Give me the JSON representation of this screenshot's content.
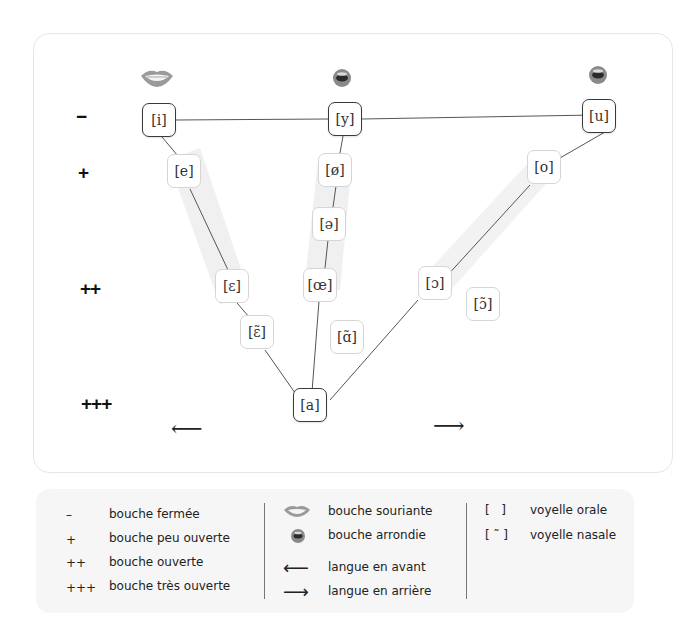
{
  "diagram": {
    "row_labels": [
      "−",
      "+",
      "++",
      "+++"
    ],
    "mouths": {
      "left": "smiling-mouth",
      "center": "rounded-mouth",
      "right": "rounded-mouth"
    },
    "arrows": {
      "left": "⟵",
      "right": "⟶"
    },
    "vowels": {
      "i": "[i]",
      "y": "[y]",
      "u": "[u]",
      "e": "[e]",
      "oe_closed": "[ø]",
      "o": "[o]",
      "schwa": "[ə]",
      "eps": "[ɛ]",
      "oe_open": "[œ]",
      "open_o": "[ɔ]",
      "nasal_o": "[ɔ̃]",
      "nasal_eps": "[ɛ̃]",
      "nasal_a": "[ɑ̃]",
      "a": "[a]"
    },
    "colors": {
      "corner_border": "#3a3a3a",
      "inner_border": "#d5d5d5",
      "band": "#efefef",
      "line": "#555555"
    }
  },
  "legend": {
    "col1": [
      {
        "symbol": "–",
        "label": "bouche fermée"
      },
      {
        "symbol": "+",
        "label": "bouche peu ouverte"
      },
      {
        "symbol": "++",
        "label": "bouche ouverte"
      },
      {
        "symbol": "+++",
        "label": "bouche très ouverte"
      }
    ],
    "col2": [
      {
        "symbol": "smiling-mouth",
        "label": "bouche souriante"
      },
      {
        "symbol": "rounded-mouth",
        "label": "bouche arrondie"
      },
      {
        "symbol": "⟵",
        "label": "langue en avant"
      },
      {
        "symbol": "⟶",
        "label": "langue en arrière"
      }
    ],
    "col3": [
      {
        "symbol": "[   ]",
        "label": "voyelle orale"
      },
      {
        "symbol": "[ ˜ ]",
        "label": "voyelle nasale"
      }
    ]
  }
}
